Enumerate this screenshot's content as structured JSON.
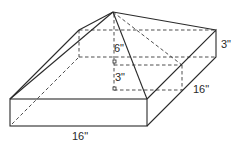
{
  "figure": {
    "labels": {
      "pyramid_height": "6\"",
      "prism_height_inner": "3\"",
      "prism_height_side": "3\"",
      "depth": "16\"",
      "width": "16\""
    },
    "colors": {
      "line": "#2a2a2a",
      "background": "#ffffff"
    }
  }
}
